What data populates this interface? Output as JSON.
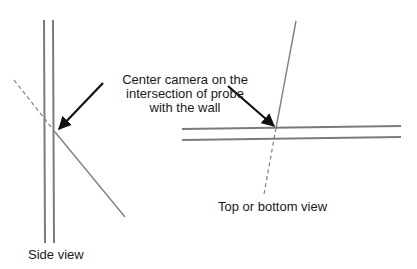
{
  "callout": {
    "lines": [
      "Center camera on the",
      "intersection of probe",
      "with the wall"
    ]
  },
  "side_view": {
    "label": "Side view"
  },
  "top_view": {
    "label": "Top or bottom view"
  },
  "colors": {
    "wall": "#7a7a7a",
    "probe": "#808080",
    "arrow": "#111111",
    "text": "#1a1a1a",
    "background": "#ffffff"
  }
}
